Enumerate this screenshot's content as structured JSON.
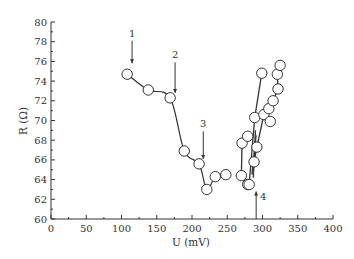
{
  "chart_data": {
    "type": "scatter",
    "title": "",
    "xlabel": "U (mV)",
    "ylabel": "R (Ω)",
    "xlim": [
      0,
      400
    ],
    "ylim": [
      60,
      80
    ],
    "x_ticks": [
      0,
      50,
      100,
      150,
      200,
      250,
      300,
      350,
      400
    ],
    "y_ticks": [
      60,
      62,
      64,
      66,
      68,
      70,
      72,
      74,
      76,
      78,
      80
    ],
    "grid": false,
    "legend": null,
    "series": [
      {
        "name": "sweep-down",
        "marker": "open-circle",
        "line": "smooth",
        "points": [
          {
            "x": 108,
            "y": 74.7
          },
          {
            "x": 138,
            "y": 73.1
          },
          {
            "x": 169,
            "y": 72.3
          },
          {
            "x": 189,
            "y": 66.9
          },
          {
            "x": 210,
            "y": 65.6
          },
          {
            "x": 221,
            "y": 63.0
          },
          {
            "x": 233,
            "y": 64.3
          },
          {
            "x": 248,
            "y": 64.5
          },
          {
            "x": 270,
            "y": 64.4
          }
        ]
      },
      {
        "name": "sweep-up",
        "marker": "open-circle",
        "line": "segments",
        "points": [
          {
            "x": 279,
            "y": 63.5
          },
          {
            "x": 281,
            "y": 63.5
          },
          {
            "x": 271,
            "y": 67.7
          },
          {
            "x": 279,
            "y": 68.4
          },
          {
            "x": 288,
            "y": 65.8
          },
          {
            "x": 292,
            "y": 67.3
          },
          {
            "x": 289,
            "y": 70.3
          },
          {
            "x": 299,
            "y": 74.8
          },
          {
            "x": 302,
            "y": 70.6
          },
          {
            "x": 311,
            "y": 69.9
          },
          {
            "x": 309,
            "y": 71.2
          },
          {
            "x": 315,
            "y": 72.0
          },
          {
            "x": 322,
            "y": 73.2
          },
          {
            "x": 321,
            "y": 74.7
          },
          {
            "x": 325,
            "y": 75.6
          }
        ]
      }
    ],
    "annotations": [
      {
        "label": "1",
        "x": 115,
        "y_from": 78.1,
        "y_to": 75.8,
        "direction": "down"
      },
      {
        "label": "2",
        "x": 176,
        "y_from": 75.9,
        "y_to": 72.8,
        "direction": "down"
      },
      {
        "label": "3",
        "x": 216,
        "y_from": 68.9,
        "y_to": 66.1,
        "direction": "down"
      },
      {
        "label": "4",
        "x": 291,
        "y_from": 60.0,
        "y_to": 62.8,
        "direction": "up"
      }
    ]
  }
}
